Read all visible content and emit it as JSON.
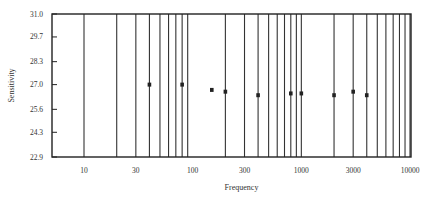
{
  "chart_data": {
    "type": "scatter",
    "title": "",
    "xlabel": "Frequency",
    "ylabel": "Sensitivity",
    "x_scale": "log",
    "xlim": [
      5.4,
      10000
    ],
    "ylim": [
      22.9,
      31.0
    ],
    "x_ticks": [
      10,
      30,
      100,
      300,
      1000,
      3000,
      10000
    ],
    "x_tick_labels": [
      "10",
      "30",
      "100",
      "300",
      "1000",
      "3000",
      "10000"
    ],
    "y_ticks": [
      31.0,
      29.7,
      28.3,
      27.0,
      25.6,
      24.3,
      22.9
    ],
    "y_tick_labels": [
      "31.0",
      "29.7",
      "28.3",
      "27.0",
      "25.6",
      "24.3",
      "22.9"
    ],
    "grid_lines_x": [
      10,
      20,
      30,
      40,
      50,
      60,
      70,
      80,
      90,
      200,
      300,
      400,
      500,
      600,
      700,
      800,
      900,
      1000,
      2000,
      3000,
      4000,
      5000,
      6000,
      7000,
      8000,
      9000,
      10000
    ],
    "legend": "none",
    "series": [
      {
        "name": "measurements",
        "x": [
          40,
          80,
          150,
          200,
          400,
          800,
          1000,
          2000,
          3000,
          4000
        ],
        "y": [
          27.0,
          27.0,
          26.7,
          26.6,
          26.4,
          26.5,
          26.5,
          26.4,
          26.6,
          26.4
        ]
      }
    ]
  },
  "colors": {
    "frame": "#222222",
    "gridline": "#333333",
    "marker": "#222222",
    "background": "#ffffff"
  }
}
